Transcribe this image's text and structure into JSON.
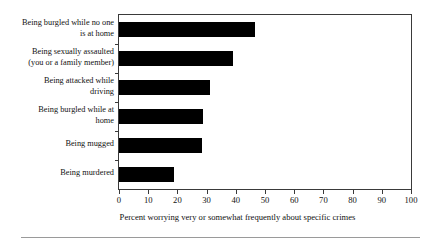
{
  "chart_data": {
    "type": "bar",
    "orientation": "horizontal",
    "title": "",
    "subtitle": "",
    "xlabel": "Percent worrying very or somewhat frequently about specific crimes",
    "ylabel": "",
    "xlim": [
      0,
      100
    ],
    "xticks": [
      0,
      10,
      20,
      30,
      40,
      50,
      60,
      70,
      80,
      90,
      100
    ],
    "xtick_labels": [
      "0",
      "10",
      "20",
      "30",
      "40",
      "50",
      "60",
      "70",
      "80",
      "90",
      "100"
    ],
    "grid": false,
    "legend": null,
    "bar_color": "#000000",
    "categories": [
      "Being burgled while no one is at home",
      "Being sexually assaulted (you or a family member)",
      "Being attacked while driving",
      "Being burgled while at home",
      "Being mugged",
      "Being murdered"
    ],
    "category_lines": [
      [
        "Being burgled while no one",
        "is at home"
      ],
      [
        "Being sexually assaulted",
        "(you or a family member)"
      ],
      [
        "Being attacked while",
        "driving"
      ],
      [
        "Being burgled while at",
        "home"
      ],
      [
        "Being mugged"
      ],
      [
        "Being murdered"
      ]
    ],
    "values": [
      46.7,
      39.2,
      31.3,
      28.9,
      28.3,
      18.7
    ]
  }
}
